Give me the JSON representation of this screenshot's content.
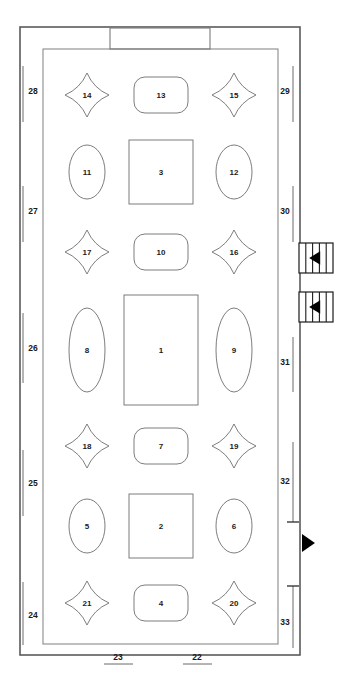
{
  "diagram": {
    "type": "floor-plan",
    "title": "",
    "background_color": "#ffffff",
    "stroke_color": "#6e6e6e",
    "outer_wall_color": "#5a5a5a",
    "marker_color": "#000000"
  },
  "stage": {
    "label": "",
    "shape": "rectangle"
  },
  "tables": [
    {
      "id": "t1",
      "label": "1",
      "shape": "rectangle",
      "cx": 161,
      "cy": 350,
      "w": 74,
      "h": 110
    },
    {
      "id": "t2",
      "label": "2",
      "shape": "rectangle",
      "cx": 161,
      "cy": 526,
      "w": 64,
      "h": 64
    },
    {
      "id": "t3",
      "label": "3",
      "shape": "rectangle",
      "cx": 161,
      "cy": 172,
      "w": 64,
      "h": 64
    },
    {
      "id": "t4",
      "label": "4",
      "shape": "rounded-rect",
      "cx": 161,
      "cy": 603,
      "w": 54,
      "h": 36
    },
    {
      "id": "t5",
      "label": "5",
      "shape": "ellipse",
      "cx": 87,
      "cy": 526,
      "w": 36,
      "h": 54
    },
    {
      "id": "t6",
      "label": "6",
      "shape": "ellipse",
      "cx": 234,
      "cy": 526,
      "w": 36,
      "h": 54
    },
    {
      "id": "t7",
      "label": "7",
      "shape": "rounded-rect",
      "cx": 161,
      "cy": 446,
      "w": 54,
      "h": 36
    },
    {
      "id": "t8",
      "label": "8",
      "shape": "ellipse",
      "cx": 87,
      "cy": 350,
      "w": 36,
      "h": 84
    },
    {
      "id": "t9",
      "label": "9",
      "shape": "ellipse",
      "cx": 234,
      "cy": 350,
      "w": 36,
      "h": 84
    },
    {
      "id": "t10",
      "label": "10",
      "shape": "rounded-rect",
      "cx": 161,
      "cy": 252,
      "w": 54,
      "h": 36
    },
    {
      "id": "t11",
      "label": "11",
      "shape": "ellipse",
      "cx": 87,
      "cy": 172,
      "w": 36,
      "h": 54
    },
    {
      "id": "t12",
      "label": "12",
      "shape": "ellipse",
      "cx": 234,
      "cy": 172,
      "w": 36,
      "h": 54
    },
    {
      "id": "t13",
      "label": "13",
      "shape": "rounded-rect",
      "cx": 161,
      "cy": 95,
      "w": 54,
      "h": 36
    },
    {
      "id": "t14",
      "label": "14",
      "shape": "star4",
      "cx": 87,
      "cy": 95,
      "w": 44,
      "h": 44
    },
    {
      "id": "t15",
      "label": "15",
      "shape": "star4",
      "cx": 234,
      "cy": 95,
      "w": 44,
      "h": 44
    },
    {
      "id": "t16",
      "label": "16",
      "shape": "star4",
      "cx": 234,
      "cy": 252,
      "w": 44,
      "h": 44
    },
    {
      "id": "t17",
      "label": "17",
      "shape": "star4",
      "cx": 87,
      "cy": 252,
      "w": 44,
      "h": 44
    },
    {
      "id": "t18",
      "label": "18",
      "shape": "star4",
      "cx": 87,
      "cy": 446,
      "w": 44,
      "h": 44
    },
    {
      "id": "t19",
      "label": "19",
      "shape": "star4",
      "cx": 234,
      "cy": 446,
      "w": 44,
      "h": 44
    },
    {
      "id": "t20",
      "label": "20",
      "shape": "star4",
      "cx": 234,
      "cy": 603,
      "w": 44,
      "h": 44
    },
    {
      "id": "t21",
      "label": "21",
      "shape": "star4",
      "cx": 87,
      "cy": 603,
      "w": 44,
      "h": 44
    }
  ],
  "dimensions": {
    "left": [
      {
        "label": "28",
        "label_x": 33,
        "label_y": 91,
        "line_x": 23,
        "y1": 66,
        "y2": 122,
        "cap_start": false,
        "cap_end": false
      },
      {
        "label": "27",
        "label_x": 33,
        "label_y": 211,
        "line_x": 23,
        "y1": 186,
        "y2": 242,
        "cap_start": false,
        "cap_end": false
      },
      {
        "label": "26",
        "label_x": 33,
        "label_y": 348,
        "line_x": 23,
        "y1": 313,
        "y2": 383,
        "cap_start": false,
        "cap_end": false
      },
      {
        "label": "25",
        "label_x": 33,
        "label_y": 483,
        "line_x": 23,
        "y1": 450,
        "y2": 516,
        "cap_start": false,
        "cap_end": false
      },
      {
        "label": "24",
        "label_x": 33,
        "label_y": 615,
        "line_x": 23,
        "y1": 582,
        "y2": 645,
        "cap_start": false,
        "cap_end": false
      }
    ],
    "right": [
      {
        "label": "29",
        "label_x": 285,
        "label_y": 91,
        "line_x": 293,
        "y1": 66,
        "y2": 122,
        "cap_start": false,
        "cap_end": false
      },
      {
        "label": "30",
        "label_x": 285,
        "label_y": 211,
        "line_x": 293,
        "y1": 186,
        "y2": 242,
        "cap_start": false,
        "cap_end": false
      },
      {
        "label": "31",
        "label_x": 285,
        "label_y": 362,
        "line_x": 293,
        "y1": 337,
        "y2": 392,
        "cap_start": false,
        "cap_end": false
      },
      {
        "label": "32",
        "label_x": 285,
        "label_y": 481,
        "line_x": 293,
        "y1": 442,
        "y2": 522,
        "cap_start": false,
        "cap_end": true
      },
      {
        "label": "33",
        "label_x": 285,
        "label_y": 622,
        "line_x": 293,
        "y1": 586,
        "y2": 648,
        "cap_start": true,
        "cap_end": false
      }
    ],
    "bottom": [
      {
        "label": "23",
        "label_x": 118,
        "label_y": 657,
        "x1": 104,
        "x2": 133,
        "y": 664
      },
      {
        "label": "22",
        "label_x": 197,
        "label_y": 657,
        "x1": 183,
        "x2": 212,
        "y": 664
      }
    ]
  },
  "doors": [
    {
      "id": "door-upper",
      "x": 299,
      "y": 243,
      "w": 34,
      "h": 30,
      "arrow": "left",
      "hatch": "vertical"
    },
    {
      "id": "door-lower",
      "x": 299,
      "y": 292,
      "w": 34,
      "h": 30,
      "arrow": "left",
      "hatch": "vertical"
    }
  ],
  "markers": [
    {
      "id": "marker-right",
      "x": 302,
      "y": 534,
      "size": 18,
      "direction": "right"
    }
  ]
}
